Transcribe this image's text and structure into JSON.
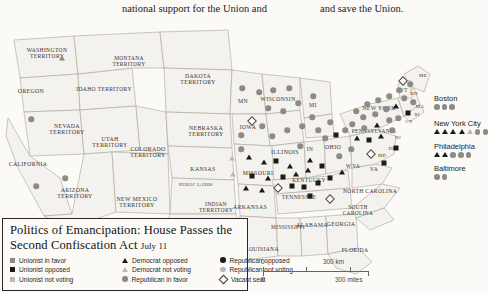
{
  "page": {
    "background": "#fbfaf7",
    "body_text": {
      "column_left": "national support for the Union and",
      "column_right": "and save the Union."
    }
  },
  "map": {
    "name": "united-states-1862-house-vote-map",
    "colors": {
      "dark": "#1d1a17",
      "mid": "#8e8a84",
      "light": "#bdb9b2",
      "land": "#f4f2ee",
      "border": "#a8a39b",
      "water": "#fbfaf7"
    },
    "labels": [
      {
        "text": "WASHINGTON\nTERRITORY",
        "x": 47,
        "y": 36,
        "size": 5.6
      },
      {
        "text": "OREGON",
        "x": 31,
        "y": 74,
        "size": 5.8
      },
      {
        "text": "IDAHO TERRITORY",
        "x": 104,
        "y": 72,
        "size": 5.6
      },
      {
        "text": "MONTANA\nTERRITORY",
        "x": 129,
        "y": 43,
        "size": 5.4
      },
      {
        "text": "DAKOTA\nTERRITORY",
        "x": 198,
        "y": 62,
        "size": 5.8
      },
      {
        "text": "NEBRASKA\nTERRITORY",
        "x": 206,
        "y": 114,
        "size": 5.8
      },
      {
        "text": "NEVADA\nTERRITORY",
        "x": 67,
        "y": 112,
        "size": 5.8
      },
      {
        "text": "UTAH\nTERRITORY",
        "x": 110,
        "y": 125,
        "size": 5.8
      },
      {
        "text": "COLORADO\nTERRITORY",
        "x": 148,
        "y": 135,
        "size": 5.8
      },
      {
        "text": "CALIFORNIA",
        "x": 28,
        "y": 147,
        "size": 5.8
      },
      {
        "text": "ARIZONA\nTERRITORY",
        "x": 75,
        "y": 176,
        "size": 5.8
      },
      {
        "text": "NEW MEXICO\nTERRITORY",
        "x": 137,
        "y": 185,
        "size": 5.8
      },
      {
        "text": "KANSAS",
        "x": 203,
        "y": 152,
        "size": 5.8
      },
      {
        "text": "PUBLIC LANDS",
        "x": 196,
        "y": 167,
        "size": 4.2
      },
      {
        "text": "INDIAN\nTERRITORY",
        "x": 216,
        "y": 190,
        "size": 5.6
      },
      {
        "text": "TEXAS",
        "x": 203,
        "y": 215,
        "size": 6.2
      },
      {
        "text": "MN",
        "x": 243,
        "y": 84,
        "size": 5.8
      },
      {
        "text": "WISCONSIN",
        "x": 278,
        "y": 82,
        "size": 5.8
      },
      {
        "text": "IOWA",
        "x": 248,
        "y": 110,
        "size": 5.8
      },
      {
        "text": "MISSOURI",
        "x": 258,
        "y": 156,
        "size": 5.8
      },
      {
        "text": "ILLINOIS",
        "x": 285,
        "y": 134,
        "size": 6.0
      },
      {
        "text": "MI",
        "x": 313,
        "y": 88,
        "size": 5.8
      },
      {
        "text": "IN",
        "x": 310,
        "y": 132,
        "size": 5.4
      },
      {
        "text": "OHIO",
        "x": 333,
        "y": 130,
        "size": 5.8
      },
      {
        "text": "KENTUCKY",
        "x": 309,
        "y": 163,
        "size": 5.6
      },
      {
        "text": "TENNESSEE",
        "x": 299,
        "y": 180,
        "size": 5.6
      },
      {
        "text": "ARKANSAS",
        "x": 250,
        "y": 190,
        "size": 5.8
      },
      {
        "text": "LOUISIANA",
        "x": 262,
        "y": 232,
        "size": 5.6
      },
      {
        "text": "MISSISSIPPI",
        "x": 288,
        "y": 210,
        "size": 5.4
      },
      {
        "text": "ALABAMA",
        "x": 312,
        "y": 208,
        "size": 5.8
      },
      {
        "text": "GEORGIA",
        "x": 341,
        "y": 207,
        "size": 5.8
      },
      {
        "text": "FLORIDA",
        "x": 355,
        "y": 233,
        "size": 5.6
      },
      {
        "text": "NORTH CAROLINA",
        "x": 370,
        "y": 174,
        "size": 5.6
      },
      {
        "text": "SOUTH\nCAROLINA",
        "x": 358,
        "y": 192,
        "size": 5.4
      },
      {
        "text": "W VA",
        "x": 353,
        "y": 149,
        "size": 5.2
      },
      {
        "text": "VA",
        "x": 374,
        "y": 152,
        "size": 5.4
      },
      {
        "text": "NEW YORK",
        "x": 379,
        "y": 91,
        "size": 5.8
      },
      {
        "text": "PENNSYLVANIA",
        "x": 374,
        "y": 114,
        "size": 5.4
      },
      {
        "text": "VT",
        "x": 404,
        "y": 73,
        "size": 5.2
      },
      {
        "text": "NH",
        "x": 414,
        "y": 76,
        "size": 5.0
      },
      {
        "text": "ME",
        "x": 423,
        "y": 58,
        "size": 5.0
      },
      {
        "text": "MA",
        "x": 420,
        "y": 89,
        "size": 4.8
      },
      {
        "text": "CT",
        "x": 409,
        "y": 104,
        "size": 4.8
      },
      {
        "text": "NJ",
        "x": 398,
        "y": 120,
        "size": 4.6
      },
      {
        "text": "DE",
        "x": 392,
        "y": 131,
        "size": 4.6
      },
      {
        "text": "MD",
        "x": 382,
        "y": 138,
        "size": 4.6
      },
      {
        "text": "RI",
        "x": 417,
        "y": 97,
        "size": 4.4
      }
    ],
    "markers": [
      {
        "t": "tr",
        "c": "mid",
        "x": 62,
        "y": 40
      },
      {
        "t": "ci",
        "c": "mid",
        "x": 31,
        "y": 101
      },
      {
        "t": "ci",
        "c": "mid",
        "x": 65,
        "y": 160
      },
      {
        "t": "ci",
        "c": "mid",
        "x": 36,
        "y": 168
      },
      {
        "t": "ci",
        "c": "mid",
        "x": 242,
        "y": 70
      },
      {
        "t": "ci",
        "c": "mid",
        "x": 259,
        "y": 74
      },
      {
        "t": "ci",
        "c": "mid",
        "x": 273,
        "y": 72
      },
      {
        "t": "ci",
        "c": "mid",
        "x": 289,
        "y": 70
      },
      {
        "t": "ci",
        "c": "mid",
        "x": 268,
        "y": 90
      },
      {
        "t": "ci",
        "c": "mid",
        "x": 283,
        "y": 93
      },
      {
        "t": "ci",
        "c": "mid",
        "x": 298,
        "y": 85
      },
      {
        "t": "ci",
        "c": "mid",
        "x": 313,
        "y": 78
      },
      {
        "t": "ci",
        "c": "mid",
        "x": 312,
        "y": 99
      },
      {
        "t": "di",
        "c": "none",
        "x": 252,
        "y": 103
      },
      {
        "t": "ci",
        "c": "mid",
        "x": 241,
        "y": 117
      },
      {
        "t": "ci",
        "c": "mid",
        "x": 262,
        "y": 108
      },
      {
        "t": "ci",
        "c": "mid",
        "x": 272,
        "y": 118
      },
      {
        "t": "ci",
        "c": "mid",
        "x": 287,
        "y": 112
      },
      {
        "t": "ci",
        "c": "mid",
        "x": 302,
        "y": 108
      },
      {
        "t": "ci",
        "c": "mid",
        "x": 318,
        "y": 112
      },
      {
        "t": "ci",
        "c": "mid",
        "x": 330,
        "y": 104
      },
      {
        "t": "ci",
        "c": "mid",
        "x": 241,
        "y": 131
      },
      {
        "t": "tr",
        "c": "light",
        "x": 232,
        "y": 140
      },
      {
        "t": "tr",
        "c": "dark",
        "x": 249,
        "y": 139
      },
      {
        "t": "tr",
        "c": "dark",
        "x": 264,
        "y": 144
      },
      {
        "t": "sq",
        "c": "dark",
        "x": 276,
        "y": 143
      },
      {
        "t": "tr",
        "c": "dark",
        "x": 290,
        "y": 148
      },
      {
        "t": "ci",
        "c": "mid",
        "x": 300,
        "y": 128
      },
      {
        "t": "tr",
        "c": "dark",
        "x": 310,
        "y": 142
      },
      {
        "t": "ci",
        "c": "mid",
        "x": 325,
        "y": 120
      },
      {
        "t": "sq",
        "c": "dark",
        "x": 336,
        "y": 117
      },
      {
        "t": "ci",
        "c": "mid",
        "x": 345,
        "y": 112
      },
      {
        "t": "tr",
        "c": "light",
        "x": 233,
        "y": 156
      },
      {
        "t": "sq",
        "c": "dark",
        "x": 252,
        "y": 158
      },
      {
        "t": "tr",
        "c": "dark",
        "x": 268,
        "y": 160
      },
      {
        "t": "sq",
        "c": "dark",
        "x": 283,
        "y": 159
      },
      {
        "t": "tr",
        "c": "dark",
        "x": 296,
        "y": 156
      },
      {
        "t": "tr",
        "c": "dark",
        "x": 308,
        "y": 152
      },
      {
        "t": "sq",
        "c": "dark",
        "x": 322,
        "y": 148
      },
      {
        "t": "ci",
        "c": "mid",
        "x": 339,
        "y": 138
      },
      {
        "t": "ci",
        "c": "mid",
        "x": 351,
        "y": 131
      },
      {
        "t": "tr",
        "c": "dark",
        "x": 246,
        "y": 170
      },
      {
        "t": "tr",
        "c": "dark",
        "x": 262,
        "y": 172
      },
      {
        "t": "di",
        "c": "none",
        "x": 278,
        "y": 170
      },
      {
        "t": "sq",
        "c": "dark",
        "x": 292,
        "y": 168
      },
      {
        "t": "sq",
        "c": "dark",
        "x": 304,
        "y": 169
      },
      {
        "t": "sq",
        "c": "dark",
        "x": 318,
        "y": 165
      },
      {
        "t": "sq",
        "c": "dark",
        "x": 330,
        "y": 160
      },
      {
        "t": "tr",
        "c": "dark",
        "x": 342,
        "y": 154
      },
      {
        "t": "sq",
        "c": "dark",
        "x": 310,
        "y": 178
      },
      {
        "t": "di",
        "c": "none",
        "x": 330,
        "y": 181
      },
      {
        "t": "ci",
        "c": "mid",
        "x": 356,
        "y": 93
      },
      {
        "t": "ci",
        "c": "mid",
        "x": 367,
        "y": 86
      },
      {
        "t": "ci",
        "c": "mid",
        "x": 378,
        "y": 82
      },
      {
        "t": "ci",
        "c": "mid",
        "x": 389,
        "y": 78
      },
      {
        "t": "ci",
        "c": "mid",
        "x": 399,
        "y": 72
      },
      {
        "t": "ci",
        "c": "mid",
        "x": 363,
        "y": 99
      },
      {
        "t": "ci",
        "c": "mid",
        "x": 375,
        "y": 96
      },
      {
        "t": "ci",
        "c": "mid",
        "x": 386,
        "y": 91
      },
      {
        "t": "tr",
        "c": "dark",
        "x": 396,
        "y": 88
      },
      {
        "t": "ci",
        "c": "mid",
        "x": 352,
        "y": 106
      },
      {
        "t": "ci",
        "c": "mid",
        "x": 364,
        "y": 110
      },
      {
        "t": "tr",
        "c": "dark",
        "x": 377,
        "y": 107
      },
      {
        "t": "ci",
        "c": "mid",
        "x": 389,
        "y": 102
      },
      {
        "t": "tr",
        "c": "dark",
        "x": 357,
        "y": 120
      },
      {
        "t": "sq",
        "c": "dark",
        "x": 369,
        "y": 122
      },
      {
        "t": "tr",
        "c": "dark",
        "x": 381,
        "y": 118
      },
      {
        "t": "ci",
        "c": "mid",
        "x": 392,
        "y": 112
      },
      {
        "t": "di",
        "c": "none",
        "x": 371,
        "y": 136
      },
      {
        "t": "sq",
        "c": "dark",
        "x": 384,
        "y": 145
      },
      {
        "t": "sq",
        "c": "dark",
        "x": 396,
        "y": 130
      },
      {
        "t": "di",
        "c": "none",
        "x": 403,
        "y": 63
      },
      {
        "t": "ci",
        "c": "mid",
        "x": 410,
        "y": 66
      },
      {
        "t": "ci",
        "c": "mid",
        "x": 404,
        "y": 80
      },
      {
        "t": "ci",
        "c": "mid",
        "x": 413,
        "y": 84
      },
      {
        "t": "sq",
        "c": "dark",
        "x": 408,
        "y": 95
      },
      {
        "t": "ci",
        "c": "mid",
        "x": 398,
        "y": 100
      }
    ],
    "cities": [
      {
        "name": "Boston",
        "x": 434,
        "y": 76,
        "symbols": [
          {
            "t": "ci",
            "c": "mid"
          },
          {
            "t": "ci",
            "c": "mid"
          },
          {
            "t": "ci",
            "c": "mid"
          }
        ]
      },
      {
        "name": "New York City",
        "x": 434,
        "y": 101,
        "symbols": [
          {
            "t": "tr",
            "c": "dark"
          },
          {
            "t": "tr",
            "c": "dark"
          },
          {
            "t": "tr",
            "c": "dark"
          },
          {
            "t": "tr",
            "c": "dark"
          },
          {
            "t": "tr",
            "c": "light"
          },
          {
            "t": "ci",
            "c": "mid"
          },
          {
            "t": "ci",
            "c": "mid"
          }
        ]
      },
      {
        "name": "Philadelphia",
        "x": 434,
        "y": 124,
        "symbols": [
          {
            "t": "tr",
            "c": "dark"
          },
          {
            "t": "tr",
            "c": "dark"
          },
          {
            "t": "ci",
            "c": "mid"
          },
          {
            "t": "ci",
            "c": "mid"
          },
          {
            "t": "ci",
            "c": "mid"
          }
        ]
      },
      {
        "name": "Baltimore",
        "x": 434,
        "y": 146,
        "symbols": [
          {
            "t": "ci",
            "c": "mid"
          },
          {
            "t": "ci",
            "c": "mid"
          }
        ]
      }
    ]
  },
  "legend": {
    "title_line1": "Politics of Emancipation: House Passes the",
    "title_line2": "Second Confiscation Act",
    "date": "July 11",
    "items": [
      {
        "label": "Unionist in favor",
        "symbol": "square",
        "shade": "mid",
        "col": 0
      },
      {
        "label": "Unionist opposed",
        "symbol": "square",
        "shade": "dark",
        "col": 0
      },
      {
        "label": "Unionist not voting",
        "symbol": "square",
        "shade": "light",
        "col": 0
      },
      {
        "label": "Democrat opposed",
        "symbol": "triangle",
        "shade": "dark",
        "col": 1
      },
      {
        "label": "Democrat not voting",
        "symbol": "triangle",
        "shade": "light",
        "col": 1
      },
      {
        "label": "Republican in favor",
        "symbol": "circle",
        "shade": "mid",
        "col": 1
      },
      {
        "label": "Republican opposed",
        "symbol": "circle",
        "shade": "dark",
        "col": 2
      },
      {
        "label": "Republican not voting",
        "symbol": "circle",
        "shade": "light",
        "col": 2
      },
      {
        "label": "Vacant seat",
        "symbol": "diamond",
        "shade": "open",
        "col": 2
      }
    ]
  },
  "scale_bar": {
    "km_zero": "0",
    "km_max": "300 km",
    "miles_zero": "0",
    "miles_max": "300 miles"
  }
}
